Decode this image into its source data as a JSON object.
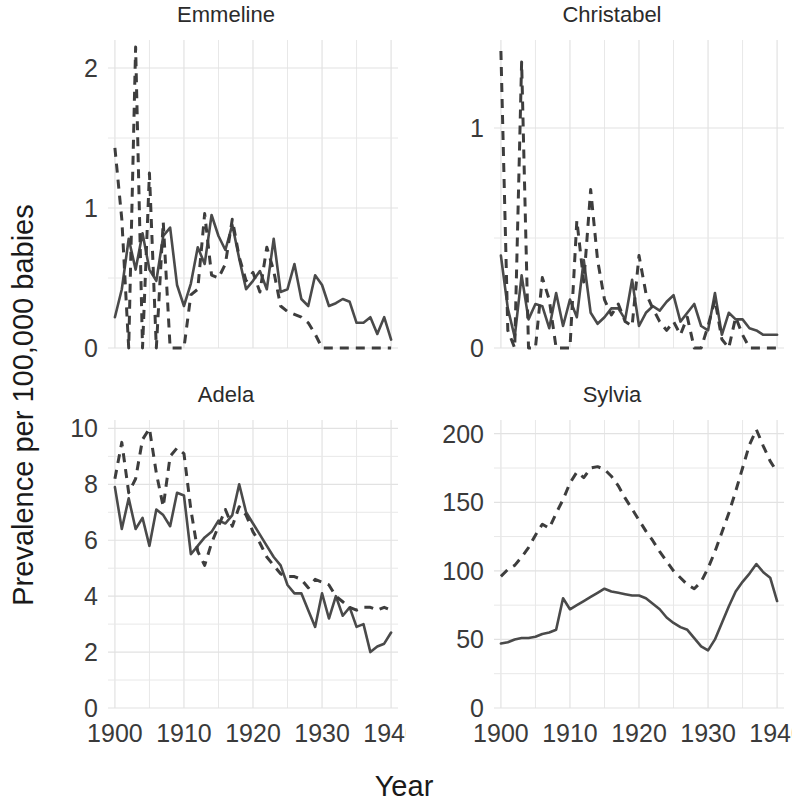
{
  "axis": {
    "ylabel": "Prevalence per 100,000 babies",
    "xlabel": "Year"
  },
  "panels": [
    {
      "title": "Emmeline"
    },
    {
      "title": "Christabel"
    },
    {
      "title": "Adela"
    },
    {
      "title": "Sylvia"
    }
  ],
  "chart_data": {
    "type": "line",
    "title": "",
    "xlabel": "Year",
    "ylabel": "Prevalence per 100,000 babies",
    "layout": "2x2 faceted small multiples",
    "grid": true,
    "legend": "none",
    "series_styles": {
      "solid": "solid line",
      "dashed": "dashed line"
    },
    "panels": [
      {
        "title": "Emmeline",
        "xlim": [
          1899,
          1941
        ],
        "ylim": [
          0,
          2.2
        ],
        "xticks": [
          1900,
          1910,
          1920,
          1930,
          1940
        ],
        "yticks": [
          0,
          1,
          2
        ],
        "x": [
          1900,
          1901,
          1902,
          1903,
          1904,
          1905,
          1906,
          1907,
          1908,
          1909,
          1910,
          1911,
          1912,
          1913,
          1914,
          1915,
          1916,
          1917,
          1918,
          1919,
          1920,
          1921,
          1922,
          1923,
          1924,
          1925,
          1926,
          1927,
          1928,
          1929,
          1930,
          1931,
          1932,
          1933,
          1934,
          1935,
          1936,
          1937,
          1938,
          1939,
          1940
        ],
        "series": [
          {
            "name": "solid",
            "style": "solid",
            "values": [
              0.22,
              0.42,
              0.78,
              0.56,
              0.82,
              0.56,
              0.48,
              0.8,
              0.86,
              0.45,
              0.3,
              0.46,
              0.72,
              0.6,
              0.95,
              0.8,
              0.7,
              0.88,
              0.64,
              0.42,
              0.48,
              0.55,
              0.42,
              0.78,
              0.4,
              0.42,
              0.6,
              0.35,
              0.3,
              0.52,
              0.45,
              0.3,
              0.32,
              0.35,
              0.33,
              0.18,
              0.18,
              0.22,
              0.1,
              0.22,
              0.06
            ]
          },
          {
            "name": "dashed",
            "style": "dashed",
            "values": [
              1.43,
              0.92,
              0.0,
              2.15,
              0.0,
              1.25,
              0.0,
              0.9,
              0.0,
              0.0,
              0.0,
              0.38,
              0.42,
              0.96,
              0.52,
              0.5,
              0.6,
              0.92,
              0.65,
              0.48,
              0.54,
              0.4,
              0.72,
              0.55,
              0.3,
              0.26,
              0.24,
              0.22,
              0.18,
              0.1,
              0.0,
              0.0,
              0.0,
              0.0,
              0.0,
              0.0,
              0.0,
              0.0,
              0.0,
              0.0,
              0.0
            ]
          }
        ]
      },
      {
        "title": "Christabel",
        "xlim": [
          1899,
          1941
        ],
        "ylim": [
          0,
          1.4
        ],
        "xticks": [
          1900,
          1910,
          1920,
          1930,
          1940
        ],
        "yticks": [
          0,
          1
        ],
        "x": [
          1900,
          1901,
          1902,
          1903,
          1904,
          1905,
          1906,
          1907,
          1908,
          1909,
          1910,
          1911,
          1912,
          1913,
          1914,
          1915,
          1916,
          1917,
          1918,
          1919,
          1920,
          1921,
          1922,
          1923,
          1924,
          1925,
          1926,
          1927,
          1928,
          1929,
          1930,
          1931,
          1932,
          1933,
          1934,
          1935,
          1936,
          1937,
          1938,
          1939,
          1940
        ],
        "series": [
          {
            "name": "solid",
            "style": "solid",
            "values": [
              0.42,
              0.18,
              0.05,
              0.33,
              0.13,
              0.2,
              0.19,
              0.09,
              0.25,
              0.1,
              0.22,
              0.14,
              0.4,
              0.16,
              0.11,
              0.14,
              0.18,
              0.18,
              0.13,
              0.31,
              0.1,
              0.16,
              0.19,
              0.17,
              0.21,
              0.24,
              0.12,
              0.16,
              0.2,
              0.1,
              0.08,
              0.25,
              0.06,
              0.16,
              0.13,
              0.13,
              0.09,
              0.08,
              0.06,
              0.06,
              0.06
            ]
          },
          {
            "name": "dashed",
            "style": "dashed",
            "values": [
              1.35,
              0.08,
              0.0,
              1.3,
              0.0,
              0.0,
              0.32,
              0.22,
              0.0,
              0.0,
              0.0,
              0.58,
              0.3,
              0.72,
              0.4,
              0.22,
              0.15,
              0.2,
              0.12,
              0.1,
              0.42,
              0.25,
              0.18,
              0.12,
              0.08,
              0.12,
              0.06,
              0.14,
              0.0,
              0.0,
              0.1,
              0.22,
              0.04,
              0.0,
              0.14,
              0.06,
              0.0,
              0.0,
              0.0,
              0.0,
              0.0
            ]
          }
        ]
      },
      {
        "title": "Adela",
        "xlim": [
          1899,
          1941
        ],
        "ylim": [
          0,
          10.3
        ],
        "xticks": [
          1900,
          1910,
          1920,
          1930,
          1940
        ],
        "yticks": [
          0,
          2,
          4,
          6,
          8,
          10
        ],
        "x": [
          1900,
          1901,
          1902,
          1903,
          1904,
          1905,
          1906,
          1907,
          1908,
          1909,
          1910,
          1911,
          1912,
          1913,
          1914,
          1915,
          1916,
          1917,
          1918,
          1919,
          1920,
          1921,
          1922,
          1923,
          1924,
          1925,
          1926,
          1927,
          1928,
          1929,
          1930,
          1931,
          1932,
          1933,
          1934,
          1935,
          1936,
          1937,
          1938,
          1939,
          1940
        ],
        "series": [
          {
            "name": "solid",
            "style": "solid",
            "values": [
              7.9,
              6.4,
              7.5,
              6.4,
              6.8,
              5.8,
              7.1,
              6.9,
              6.5,
              7.7,
              7.6,
              5.5,
              5.8,
              6.1,
              6.3,
              6.7,
              6.6,
              6.9,
              8.0,
              7.0,
              6.6,
              6.2,
              5.8,
              5.4,
              5.1,
              4.4,
              4.1,
              4.1,
              3.5,
              2.9,
              4.1,
              3.2,
              4.0,
              3.3,
              3.6,
              2.9,
              3.0,
              2.0,
              2.2,
              2.3,
              2.7
            ]
          },
          {
            "name": "dashed",
            "style": "dashed",
            "values": [
              8.2,
              9.5,
              7.7,
              8.2,
              9.6,
              10.0,
              8.4,
              7.2,
              9.0,
              9.3,
              9.1,
              7.1,
              5.6,
              5.1,
              5.9,
              6.5,
              7.1,
              6.5,
              7.2,
              6.9,
              6.3,
              5.9,
              5.4,
              5.1,
              4.8,
              4.7,
              4.7,
              4.6,
              4.3,
              4.6,
              4.5,
              4.4,
              4.0,
              3.8,
              3.6,
              3.5,
              3.6,
              3.6,
              3.5,
              3.6,
              3.5
            ]
          }
        ]
      },
      {
        "title": "Sylvia",
        "xlim": [
          1899,
          1941
        ],
        "ylim": [
          0,
          210
        ],
        "xticks": [
          1900,
          1910,
          1920,
          1930,
          1940
        ],
        "yticks": [
          0,
          50,
          100,
          150,
          200
        ],
        "x": [
          1900,
          1901,
          1902,
          1903,
          1904,
          1905,
          1906,
          1907,
          1908,
          1909,
          1910,
          1911,
          1912,
          1913,
          1914,
          1915,
          1916,
          1917,
          1918,
          1919,
          1920,
          1921,
          1922,
          1923,
          1924,
          1925,
          1926,
          1927,
          1928,
          1929,
          1930,
          1931,
          1932,
          1933,
          1934,
          1935,
          1936,
          1937,
          1938,
          1939,
          1940
        ],
        "series": [
          {
            "name": "solid",
            "style": "solid",
            "values": [
              47,
              48,
              50,
              51,
              51,
              52,
              54,
              55,
              57,
              80,
              72,
              75,
              78,
              81,
              84,
              87,
              85,
              84,
              83,
              82,
              82,
              80,
              76,
              72,
              66,
              62,
              59,
              57,
              51,
              45,
              42,
              50,
              62,
              74,
              85,
              92,
              98,
              105,
              99,
              95,
              78
            ]
          },
          {
            "name": "dashed",
            "style": "dashed",
            "values": [
              96,
              101,
              104,
              110,
              117,
              126,
              134,
              131,
              142,
              152,
              164,
              172,
              168,
              175,
              176,
              174,
              169,
              162,
              153,
              145,
              137,
              129,
              122,
              114,
              107,
              100,
              95,
              90,
              87,
              92,
              102,
              114,
              128,
              142,
              158,
              175,
              192,
              203,
              191,
              180,
              172
            ]
          }
        ]
      }
    ]
  }
}
